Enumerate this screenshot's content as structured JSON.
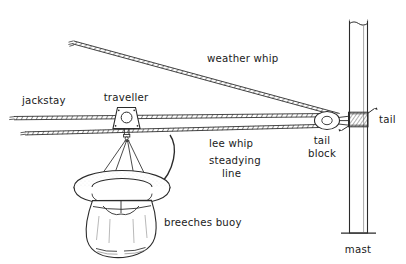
{
  "figure": {
    "background_color": "#ffffff",
    "line_color": "#2b2b2b",
    "text_color": "#1a1a1a"
  },
  "labels": {
    "jackstay": "jackstay",
    "traveller": "traveller",
    "weather_whip": "weather whip",
    "lee_whip": "lee whip",
    "steadying_line_1": "steadying",
    "steadying_line_2": "line",
    "breeches_buoy": "breeches buoy",
    "tail_block_1": "tail",
    "tail_block_2": "block",
    "tail": "tail",
    "mast": "mast"
  },
  "parts": {
    "jackstay": {
      "name": "jackstay",
      "kind": "rope"
    },
    "weather_whip": {
      "name": "weather whip",
      "kind": "rope"
    },
    "lee_whip": {
      "name": "lee whip",
      "kind": "rope"
    },
    "traveller": {
      "name": "traveller",
      "kind": "block"
    },
    "steadying_line": {
      "name": "steadying line",
      "kind": "rope"
    },
    "breeches_buoy": {
      "name": "breeches buoy",
      "kind": "buoy"
    },
    "tail_block": {
      "name": "tail block",
      "kind": "block"
    },
    "tail": {
      "name": "tail",
      "kind": "lashing"
    },
    "mast": {
      "name": "mast",
      "kind": "spar"
    }
  }
}
